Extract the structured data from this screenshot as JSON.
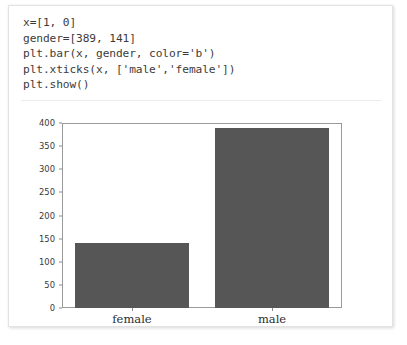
{
  "cell": {
    "code_lines": [
      "x=[1, 0]",
      "gender=[389, 141]",
      "plt.bar(x, gender, color='b')",
      "plt.xticks(x, ['male','female'])",
      "plt.show()"
    ]
  },
  "chart_data": {
    "type": "bar",
    "title": "",
    "xlabel": "",
    "ylabel": "",
    "categories": [
      "female",
      "male"
    ],
    "values": [
      141,
      389
    ],
    "x_positions": [
      0,
      1
    ],
    "series": [
      {
        "name": "gender",
        "values": [
          141,
          389
        ],
        "color": "#565656"
      }
    ],
    "ylim": [
      0,
      400
    ],
    "yticks": [
      0,
      50,
      100,
      150,
      200,
      250,
      300,
      350,
      400
    ],
    "ytick_labels": [
      "0",
      "50",
      "100",
      "150",
      "200",
      "250",
      "300",
      "350",
      "400"
    ],
    "xtick_labels": [
      "female",
      "male"
    ],
    "grid": false,
    "legend": "none",
    "bar_color": "#565656",
    "frame_color": "#9a9a9a"
  }
}
